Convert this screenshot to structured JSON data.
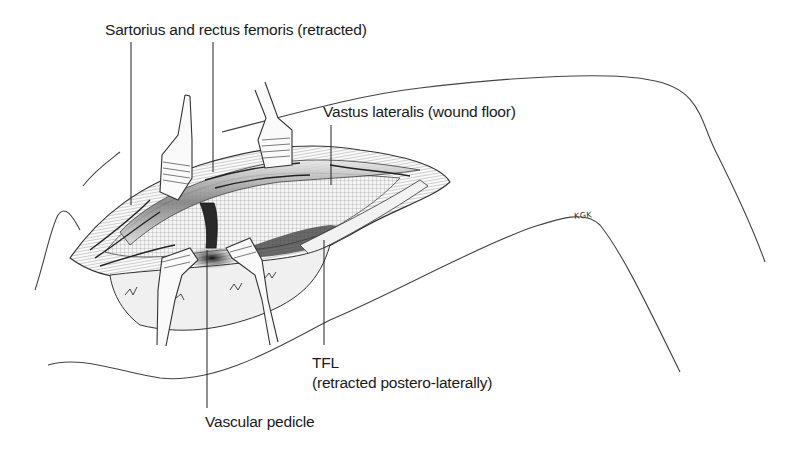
{
  "figure": {
    "type": "surgical anatomical illustration",
    "labels": {
      "sartorius": "Sartorius and rectus femoris (retracted)",
      "vastus": "Vastus lateralis (wound floor)",
      "tfl_line1": "TFL",
      "tfl_line2": "(retracted postero-laterally)",
      "pedicle": "Vascular pedicle"
    },
    "signature": "KGK",
    "colors": {
      "ink": "#1a1a1a",
      "line": "#3a3a3a",
      "shade": "#555555",
      "background": "#ffffff"
    }
  }
}
